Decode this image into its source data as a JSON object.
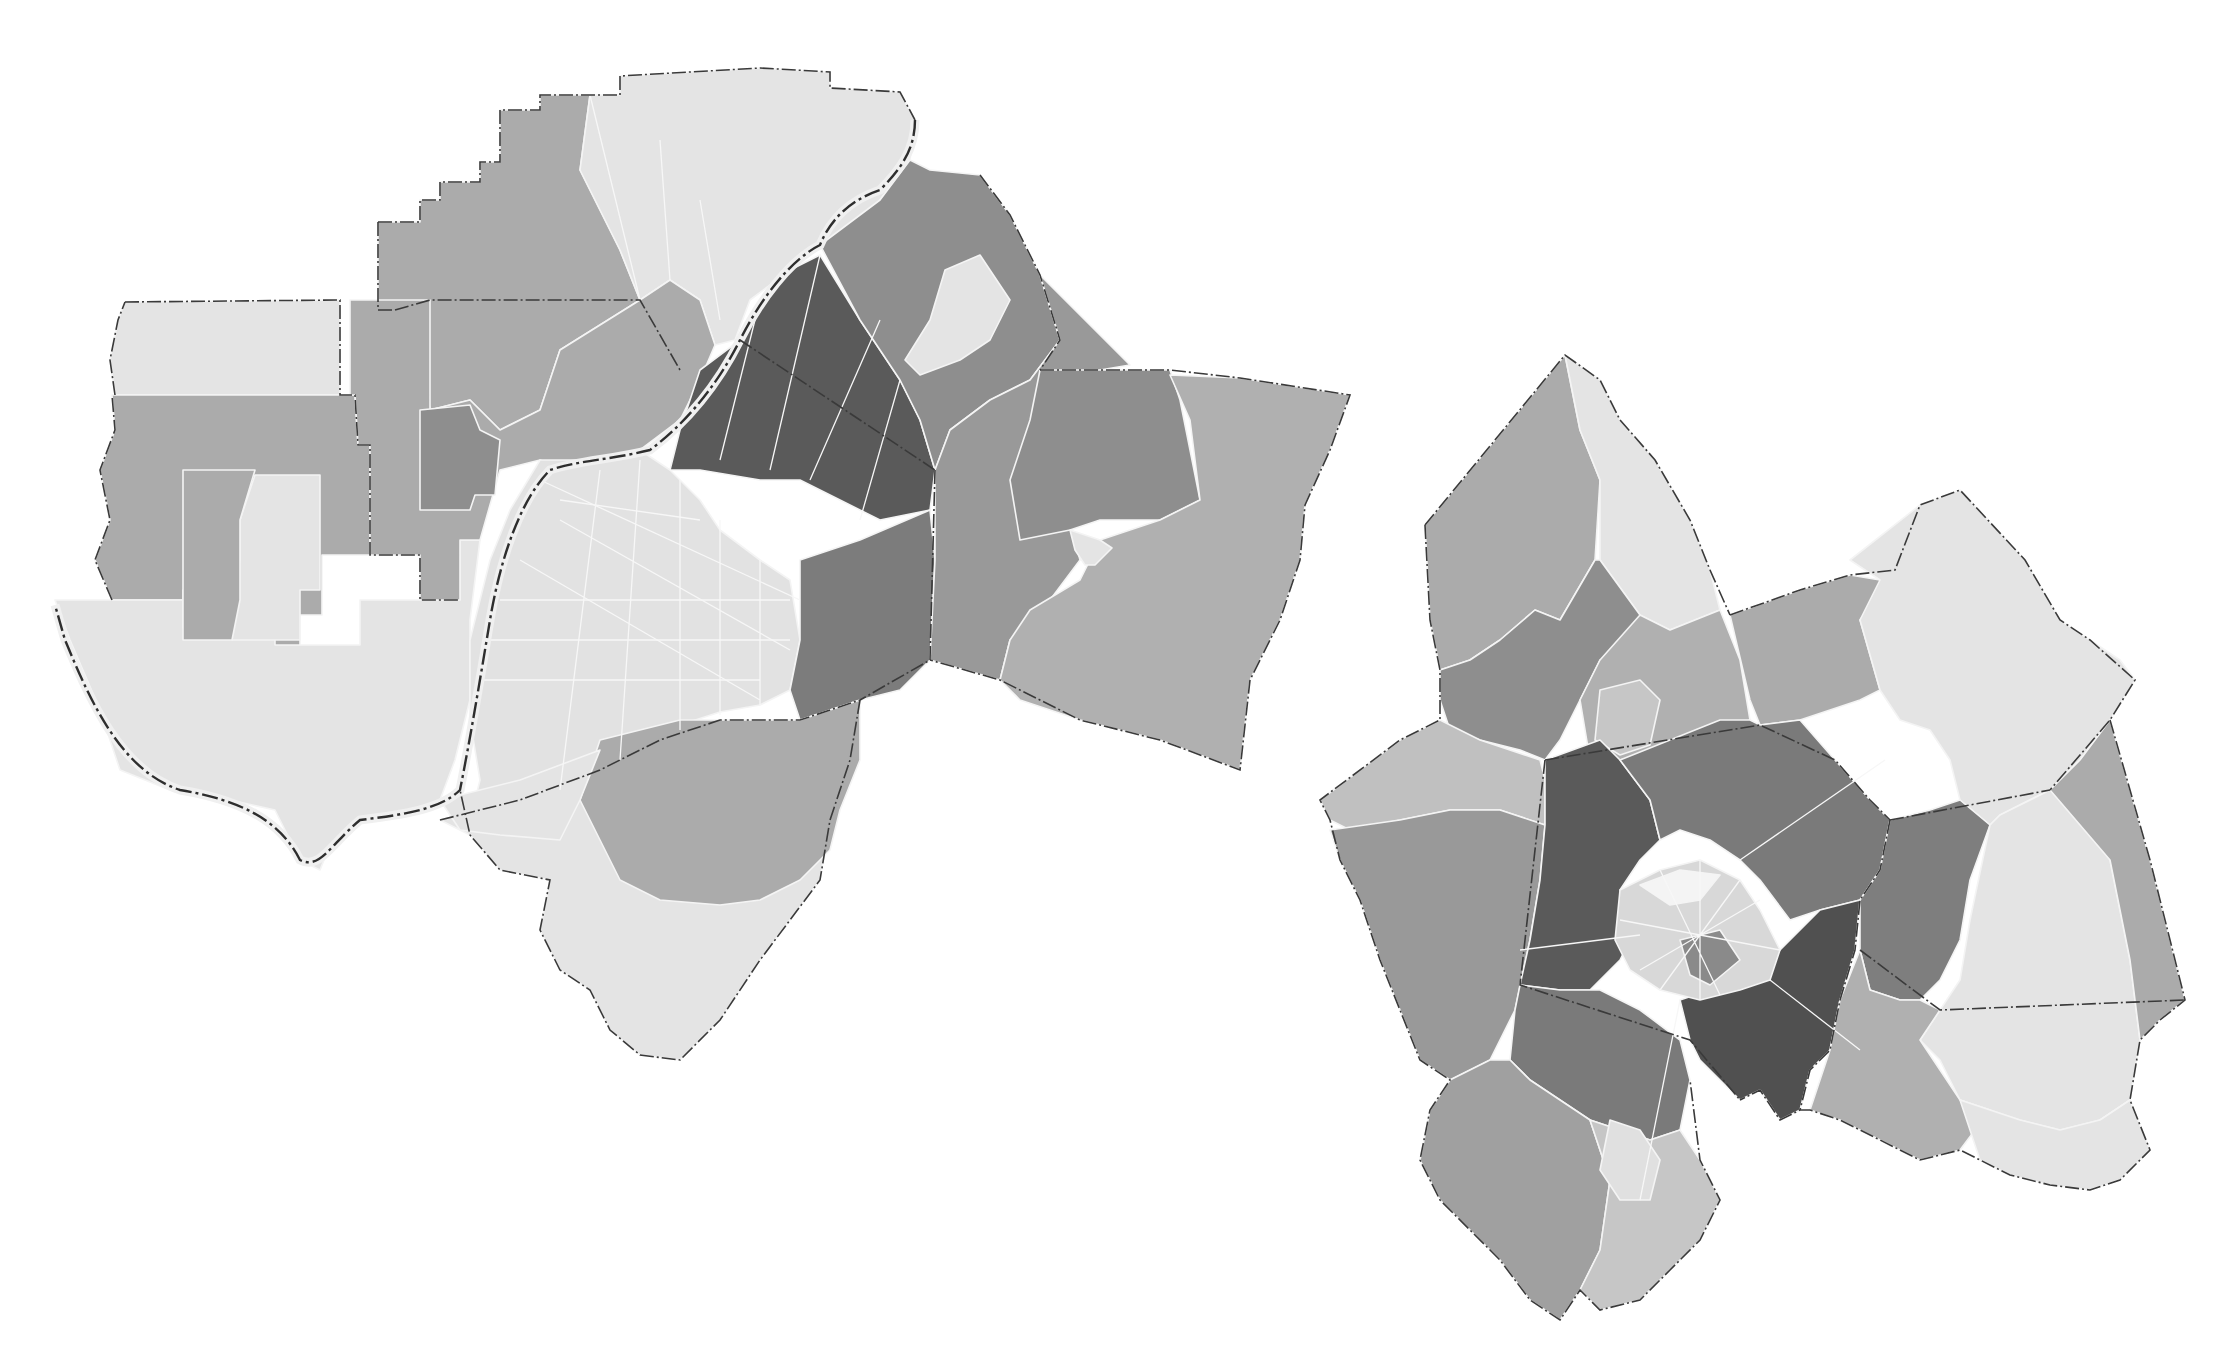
{
  "caption": {
    "text": "",
    "note": "Caption text at top edge is clipped and illegible"
  },
  "palette": {
    "class_1": "#e4e4e4",
    "class_2": "#c6c6c6",
    "class_3": "#ababab",
    "class_4": "#8e8e8e",
    "class_5": "#5a5a5a",
    "core_white": "#f2f2f2",
    "boundary": "#333333",
    "background": "#ffffff"
  },
  "maps": [
    {
      "name": "louisville-metro",
      "description": "Louisville metropolitan area choropleth (Indiana counties north/west of Ohio River, Kentucky counties south/east)",
      "regions": [
        {
          "id": "ind-nw-top",
          "class": "class_1"
        },
        {
          "id": "ind-w-band",
          "class": "class_3"
        },
        {
          "id": "ind-sw-loop",
          "class": "class_1"
        },
        {
          "id": "ind-sw-mid-light",
          "class": "class_1"
        },
        {
          "id": "ind-sw-mid-med",
          "class": "class_3"
        },
        {
          "id": "ind-n-county",
          "class": "class_3"
        },
        {
          "id": "ind-ne-light",
          "class": "class_1"
        },
        {
          "id": "ind-center",
          "class": "class_3"
        },
        {
          "id": "ind-center-dark",
          "class": "class_4"
        },
        {
          "id": "ky-downtown-core",
          "class": "class_1"
        },
        {
          "id": "ky-east-dark",
          "class": "class_5"
        },
        {
          "id": "ky-northeast",
          "class": "class_4"
        },
        {
          "id": "ky-ne-light",
          "class": "class_1"
        },
        {
          "id": "ky-southeast-dark",
          "class": "class_4"
        },
        {
          "id": "ky-oldham-east",
          "class": "class_3"
        },
        {
          "id": "ky-shelby-west",
          "class": "class_4"
        },
        {
          "id": "ky-shelby-east",
          "class": "class_3"
        },
        {
          "id": "ky-south-light",
          "class": "class_1"
        },
        {
          "id": "ky-bullitt-med",
          "class": "class_3"
        },
        {
          "id": "ky-sw-light",
          "class": "class_1"
        }
      ]
    },
    {
      "name": "lexington-metro",
      "description": "Lexington-Fayette metropolitan area choropleth with central urban core",
      "regions": [
        {
          "id": "scott-north-light",
          "class": "class_1"
        },
        {
          "id": "scott-west",
          "class": "class_3"
        },
        {
          "id": "scott-dark",
          "class": "class_4"
        },
        {
          "id": "bourbon-west",
          "class": "class_3"
        },
        {
          "id": "bourbon-east-light",
          "class": "class_1"
        },
        {
          "id": "woodford-north",
          "class": "class_2"
        },
        {
          "id": "woodford-south",
          "class": "class_4"
        },
        {
          "id": "fayette-nw-dark",
          "class": "class_5"
        },
        {
          "id": "fayette-ne",
          "class": "class_4"
        },
        {
          "id": "fayette-sw",
          "class": "class_4"
        },
        {
          "id": "fayette-se-dark",
          "class": "class_5"
        },
        {
          "id": "clark-west",
          "class": "class_4"
        },
        {
          "id": "clark-light",
          "class": "class_1"
        },
        {
          "id": "clark-east",
          "class": "class_3"
        },
        {
          "id": "madison-west",
          "class": "class_3"
        },
        {
          "id": "madison-east-light",
          "class": "class_1"
        },
        {
          "id": "jessamine-west",
          "class": "class_3"
        },
        {
          "id": "jessamine-center",
          "class": "class_2"
        },
        {
          "id": "lexington-core",
          "class": "core_white"
        }
      ]
    }
  ]
}
